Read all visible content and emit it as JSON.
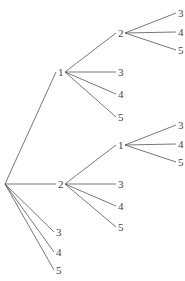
{
  "diagram": {
    "type": "tree",
    "root": {
      "x": 5,
      "y": 184
    },
    "nodes": [
      {
        "id": "a1",
        "label": "1",
        "x": 60,
        "y": 72,
        "parent": "root"
      },
      {
        "id": "a2",
        "label": "2",
        "x": 60,
        "y": 184,
        "parent": "root"
      },
      {
        "id": "a3",
        "label": "3",
        "x": 58,
        "y": 232,
        "parent": "root"
      },
      {
        "id": "a4",
        "label": "4",
        "x": 58,
        "y": 252,
        "parent": "root"
      },
      {
        "id": "a5",
        "label": "5",
        "x": 58,
        "y": 270,
        "parent": "root"
      },
      {
        "id": "b12",
        "label": "2",
        "x": 120,
        "y": 33,
        "parent": "a1"
      },
      {
        "id": "b13",
        "label": "3",
        "x": 120,
        "y": 72,
        "parent": "a1"
      },
      {
        "id": "b14",
        "label": "4",
        "x": 120,
        "y": 94,
        "parent": "a1"
      },
      {
        "id": "b15",
        "label": "5",
        "x": 120,
        "y": 117,
        "parent": "a1"
      },
      {
        "id": "c123",
        "label": "3",
        "x": 180,
        "y": 13,
        "parent": "b12"
      },
      {
        "id": "c124",
        "label": "4",
        "x": 180,
        "y": 32,
        "parent": "b12"
      },
      {
        "id": "c125",
        "label": "5",
        "x": 180,
        "y": 50,
        "parent": "b12"
      },
      {
        "id": "b21",
        "label": "1",
        "x": 120,
        "y": 145,
        "parent": "a2"
      },
      {
        "id": "b23",
        "label": "3",
        "x": 120,
        "y": 184,
        "parent": "a2"
      },
      {
        "id": "b24",
        "label": "4",
        "x": 120,
        "y": 206,
        "parent": "a2"
      },
      {
        "id": "b25",
        "label": "5",
        "x": 120,
        "y": 227,
        "parent": "a2"
      },
      {
        "id": "c213",
        "label": "3",
        "x": 180,
        "y": 125,
        "parent": "b21"
      },
      {
        "id": "c214",
        "label": "4",
        "x": 180,
        "y": 144,
        "parent": "b21"
      },
      {
        "id": "c215",
        "label": "5",
        "x": 180,
        "y": 162,
        "parent": "b21"
      }
    ]
  }
}
